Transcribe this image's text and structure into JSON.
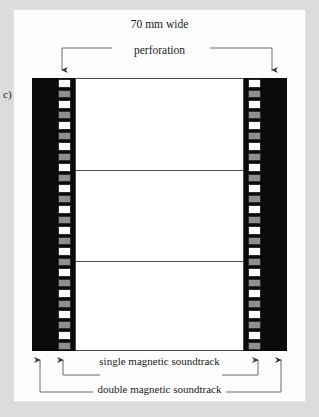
{
  "figure": {
    "label": "c)",
    "width_caption": "70 mm wide",
    "perforation_label": "perforation",
    "single_soundtrack_label": "single magnetic soundtrack",
    "double_soundtrack_label": "double magnetic soundtrack",
    "colors": {
      "page_background": "#dcdcdc",
      "card_background": "#fdfdfd",
      "film_base": "#0a0a0a",
      "perforation_hole": "#ffffff",
      "magnetic_stripe": "#8f8f8f",
      "picture_area": "#ffffff",
      "line": "#4a4a4a",
      "text": "#1a1a1a"
    },
    "film": {
      "frames": 3,
      "perforation_columns": 2,
      "perforation_cells_per_column": 26,
      "cell_pattern": [
        "hole",
        "magnetic"
      ]
    },
    "icons": {
      "arrow_down": "arrow-down-icon",
      "arrow_up": "arrow-up-icon"
    }
  }
}
